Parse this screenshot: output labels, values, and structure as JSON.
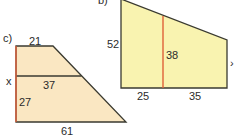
{
  "figure_b": {
    "part_label": "b)",
    "left_side": "52",
    "middle_height": "38",
    "bottom_left": "25",
    "bottom_right": "35",
    "edge_mark": "›",
    "fill_color": "#f9f3b0",
    "stroke_color": "#3a3a30",
    "highlight_color": "#e0603a"
  },
  "figure_c": {
    "part_label": "c)",
    "top": "21",
    "unknown": "x",
    "middle": "37",
    "lower_height": "27",
    "bottom": "61",
    "fill_color": "#fae7c2",
    "stroke_color": "#3a3a30",
    "highlight_color": "#e0603a"
  }
}
